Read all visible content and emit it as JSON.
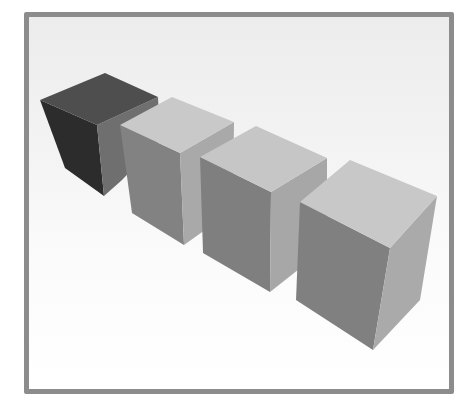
{
  "scene": {
    "description": "Four grey 3D boxes in a diagonal row inside a grey-bordered frame",
    "frame_border_color": "#8c8c8c",
    "background_top": "#ececec",
    "background_bottom": "#ffffff",
    "boxes": [
      {
        "name": "box-1",
        "top": "#4e4e4e",
        "left": "#2c2c2c",
        "right": "#6f6f6f"
      },
      {
        "name": "box-2",
        "top": "#c9c9c9",
        "left": "#828282",
        "right": "#a9a9a9"
      },
      {
        "name": "box-3",
        "top": "#c6c6c6",
        "left": "#7f7f7f",
        "right": "#a7a7a7"
      },
      {
        "name": "box-4",
        "top": "#c8c8c8",
        "left": "#808080",
        "right": "#aaaaaa"
      }
    ]
  }
}
